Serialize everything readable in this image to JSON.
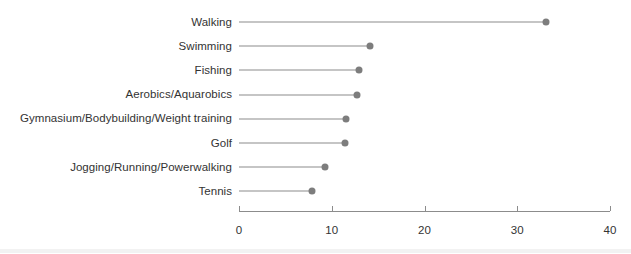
{
  "chart_data": {
    "type": "bar",
    "subtype": "lollipop-horizontal",
    "title": "",
    "subtitle": "",
    "xlabel": "",
    "ylabel": "",
    "xlim": [
      0,
      40
    ],
    "xticks": [
      0,
      10,
      20,
      30,
      40
    ],
    "xtick_labels": [
      "0",
      "10",
      "20",
      "30",
      "40"
    ],
    "grid": false,
    "legend": null,
    "orientation": "horizontal",
    "marker": "circle",
    "marker_color": "#7d7d7d",
    "line_color": "#8c8c8c",
    "axis_color": "#8c8c8c",
    "text_color": "#333333",
    "background_color": "#ffffff",
    "categories": [
      "Walking",
      "Swimming",
      "Fishing",
      "Aerobics/Aquarobics",
      "Gymnasium/Bodybuilding/Weight training",
      "Golf",
      "Jogging/Running/Powerwalking",
      "Tennis"
    ],
    "values": [
      33.1,
      14.1,
      12.9,
      12.7,
      11.5,
      11.4,
      9.3,
      7.9
    ]
  },
  "axis": {
    "ticks": [
      {
        "label": "0",
        "value": 0
      },
      {
        "label": "10",
        "value": 10
      },
      {
        "label": "20",
        "value": 20
      },
      {
        "label": "30",
        "value": 30
      },
      {
        "label": "40",
        "value": 40
      }
    ]
  },
  "rows": [
    {
      "label": "Walking",
      "value": 33.1
    },
    {
      "label": "Swimming",
      "value": 14.1
    },
    {
      "label": "Fishing",
      "value": 12.9
    },
    {
      "label": "Aerobics/Aquarobics",
      "value": 12.7
    },
    {
      "label": "Gymnasium/Bodybuilding/Weight training",
      "value": 11.5
    },
    {
      "label": "Golf",
      "value": 11.4
    },
    {
      "label": "Jogging/Running/Powerwalking",
      "value": 9.3
    },
    {
      "label": "Tennis",
      "value": 7.9
    }
  ]
}
